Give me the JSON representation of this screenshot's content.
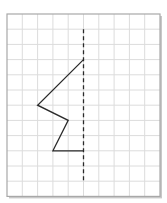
{
  "diagram": {
    "type": "symmetry-grid",
    "colors": {
      "background": "#ffffff",
      "grid_line": "#dcdcdc",
      "border": "#a8a8a8",
      "shadow": "#c8c8c8",
      "shape": "#2a2a2a",
      "axis": "#2a2a2a"
    },
    "grid": {
      "columns": 10,
      "rows": 12,
      "left": 7,
      "top": 14,
      "cell_w": 15.3,
      "cell_h": 15.2
    },
    "symmetry_axis": {
      "style": "dashed",
      "col": 5,
      "row_start": 1,
      "row_end": 11
    },
    "shape_polyline": [
      {
        "col": 5,
        "row": 3
      },
      {
        "col": 2,
        "row": 6
      },
      {
        "col": 4,
        "row": 7
      },
      {
        "col": 3,
        "row": 9
      },
      {
        "col": 5,
        "row": 9
      }
    ]
  }
}
